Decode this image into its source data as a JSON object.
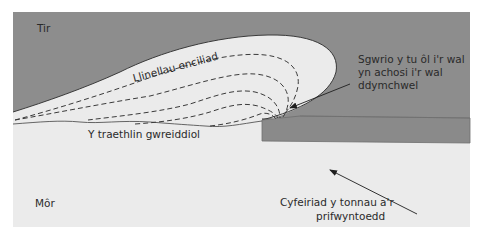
{
  "diagram": {
    "colors": {
      "land": "#8d8d8d",
      "sea": "#ebebeb",
      "wall": "#8a8a8a",
      "outline": "#3a3a3a",
      "text": "#2a2a2a",
      "page_background": "#ffffff"
    },
    "labels": {
      "land": "Tir",
      "sea": "Môr",
      "retreat_lines": "Llinellau enciliad",
      "original_coastline": "Y traethlin gwreiddiol",
      "scour_line1": "Sgwrio y tu ôl i'r wal",
      "scour_line2": "yn achosi i'r wal",
      "scour_line3": "ddymchwel",
      "wave_dir_line1": "Cyfeiriad y tonnau a'r",
      "wave_dir_line2": "prifwyntoedd"
    },
    "elements": {
      "dashed_retreat_lines_count": 5,
      "arrows": [
        "scour-arrow",
        "wave-direction-arrow"
      ]
    }
  }
}
